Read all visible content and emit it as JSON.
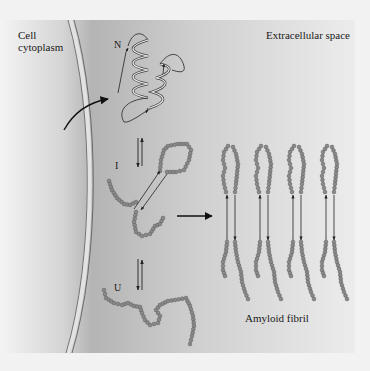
{
  "diagram": {
    "regions": {
      "intracellular": "Cell\ncytoplasm",
      "extracellular": "Extracellular space"
    },
    "states": {
      "native": "N",
      "intermediate": "I",
      "unfolded": "U"
    },
    "product": "Amyloid fibril",
    "fibril_strand_count": 4,
    "colors": {
      "panel_dark": "#a9a9a9",
      "panel_light": "#e6e6e6",
      "page_bg": "#f2f2f2",
      "bead": "#8a8a8a",
      "bead_outline": "#5a5a5a",
      "line": "#222222",
      "membrane": "#d8d8d8"
    }
  }
}
